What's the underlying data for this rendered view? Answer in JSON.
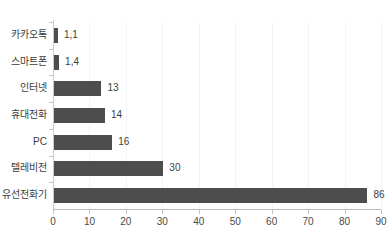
{
  "title": {
    "text": "",
    "right_text": ""
  },
  "chart_data": {
    "type": "bar",
    "orientation": "horizontal",
    "title": "",
    "xlabel": "",
    "ylabel": "",
    "xlim": [
      0,
      90
    ],
    "xticks": [
      0,
      10,
      20,
      30,
      40,
      50,
      60,
      70,
      80,
      90
    ],
    "xtick_labels": [
      "0",
      "10",
      "20",
      "30",
      "40",
      "50",
      "60",
      "70",
      "80",
      "90"
    ],
    "grid": true,
    "grid_axis": "x",
    "legend": false,
    "bar_color": "#4d4d4d",
    "text_color": "#3c3c3c",
    "background": "#ffffff",
    "categories": [
      "카카오톡",
      "스마트폰",
      "인터넷",
      "휴대전화",
      "PC",
      "텔레비전",
      "유선전화기"
    ],
    "values": [
      1.1,
      1.4,
      13,
      14,
      16,
      30,
      86
    ],
    "value_labels": [
      "1,1",
      "1,4",
      "13",
      "14",
      "16",
      "30",
      "86"
    ]
  }
}
